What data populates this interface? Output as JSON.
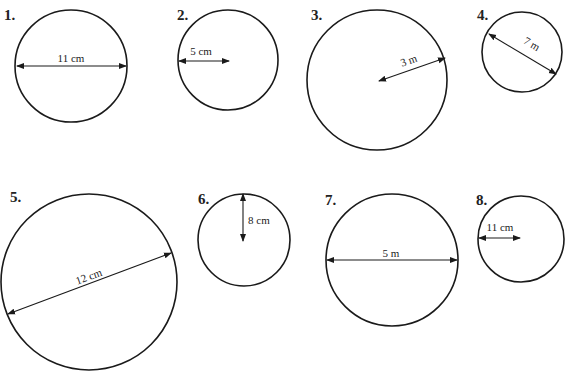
{
  "circles": [
    {
      "number": "1.",
      "label": "11 cm",
      "measure": "diameter",
      "value": 11,
      "unit": "cm"
    },
    {
      "number": "2.",
      "label": "5 cm",
      "measure": "radius",
      "value": 5,
      "unit": "cm"
    },
    {
      "number": "3.",
      "label": "3 m",
      "measure": "radius",
      "value": 3,
      "unit": "m"
    },
    {
      "number": "4.",
      "label": "7 m",
      "measure": "diameter",
      "value": 7,
      "unit": "m"
    },
    {
      "number": "5.",
      "label": "12 cm",
      "measure": "diameter",
      "value": 12,
      "unit": "cm"
    },
    {
      "number": "6.",
      "label": "8 cm",
      "measure": "radius",
      "value": 8,
      "unit": "cm"
    },
    {
      "number": "7.",
      "label": "5 m",
      "measure": "diameter",
      "value": 5,
      "unit": "m"
    },
    {
      "number": "8.",
      "label": "11 cm",
      "measure": "radius",
      "value": 11,
      "unit": "cm"
    }
  ]
}
